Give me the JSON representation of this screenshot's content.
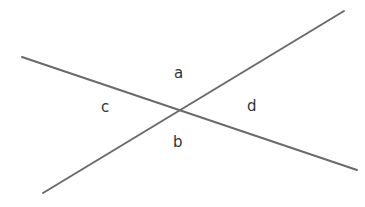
{
  "figure": {
    "background_color": "#ffffff",
    "width": 365,
    "height": 207,
    "line_color": "#6a6a6a",
    "line_width": 2,
    "label_color": "#333333",
    "intersection": {
      "x": 178,
      "y": 110
    },
    "lines": [
      {
        "name": "descending-line",
        "x1": 22,
        "y1": 57,
        "x2": 357,
        "y2": 170
      },
      {
        "name": "ascending-line",
        "x1": 43,
        "y1": 193,
        "x2": 344,
        "y2": 11
      }
    ],
    "labels": {
      "a": "a",
      "b": "b",
      "c": "c",
      "d": "d"
    }
  },
  "chart_data": {
    "type": "diagram",
    "title": "",
    "elements": [
      {
        "kind": "line",
        "label": "descending-line",
        "from": [
          22,
          57
        ],
        "to": [
          357,
          170
        ],
        "color": "#6a6a6a"
      },
      {
        "kind": "line",
        "label": "ascending-line",
        "from": [
          43,
          193
        ],
        "to": [
          344,
          11
        ],
        "color": "#6a6a6a"
      },
      {
        "kind": "point",
        "label": "intersection",
        "at": [
          178,
          110
        ]
      },
      {
        "kind": "text",
        "label": "a",
        "at": [
          180,
          74
        ],
        "region": "top-angle"
      },
      {
        "kind": "text",
        "label": "b",
        "at": [
          179,
          143
        ],
        "region": "bottom-angle"
      },
      {
        "kind": "text",
        "label": "c",
        "at": [
          106,
          108
        ],
        "region": "left-angle"
      },
      {
        "kind": "text",
        "label": "d",
        "at": [
          252,
          107
        ],
        "region": "right-angle"
      }
    ]
  }
}
